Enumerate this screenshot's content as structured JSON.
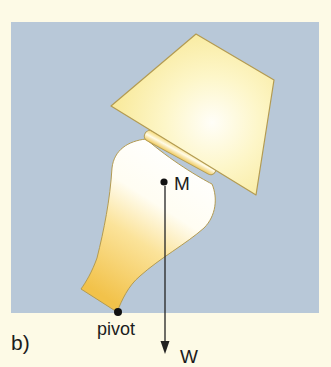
{
  "figure": {
    "panel_label": "b)",
    "labels": {
      "center_of_mass": "M",
      "pivot": "pivot",
      "weight": "W"
    },
    "colors": {
      "page_background": "#fdfae6",
      "panel_background": "#b8c8d8",
      "lamp_outline": "#b39b52",
      "lamp_light": "#fffef6",
      "lamp_shade_yellow": "#f9eda0",
      "lamp_base_gold": "#f2c54e",
      "marker": "#111111"
    },
    "elements": {
      "lampshade": "trapezoid lampshade tilted",
      "collar": "rounded collar between shade and base",
      "lamp_base": "vase-shaped lamp base",
      "center_of_mass_dot": "M",
      "pivot_dot": "pivot",
      "weight_arrow": "W, vertical downward from M"
    }
  }
}
